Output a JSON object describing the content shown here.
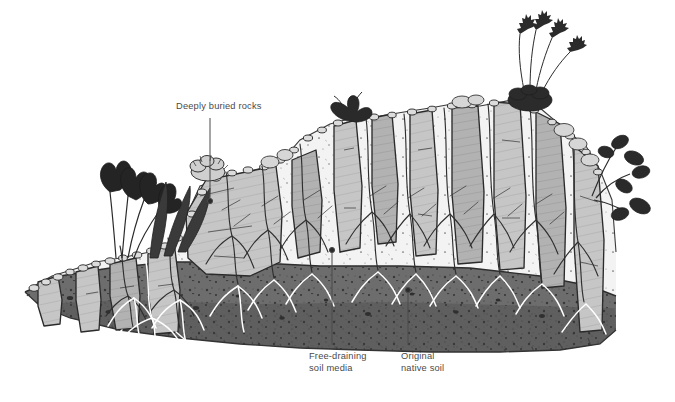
{
  "figure": {
    "type": "cross-section-illustration",
    "medium": "pen-and-ink hatched drawing",
    "background_color": "#ffffff"
  },
  "labels": {
    "deeply_buried_rocks": "Deeply buried rocks",
    "free_draining_media": "Free-draining\nsoil media",
    "original_native_soil": "Original\nnative soil"
  },
  "leaders": [
    {
      "name": "leader-deeply-buried-rocks",
      "x": 210,
      "y1": 118,
      "y2": 201
    },
    {
      "name": "leader-free-draining-media",
      "x": 332,
      "y1": 250,
      "y2": 345
    },
    {
      "name": "leader-original-native-soil",
      "x": 408,
      "y1": 290,
      "y2": 345
    }
  ],
  "colors": {
    "ink": "#2b2b2b",
    "label_text": "#4a4a4a",
    "rock_fill": "#c6c6c6",
    "rock_fill_dark": "#b0b0b0",
    "media_fill": "#f2f2f2",
    "native_soil": "#6d6d6d",
    "native_soil_dark": "#5a5a5a",
    "foliage_dark": "#2e2e2e",
    "gravel_mulch": "#d8d8d8"
  },
  "strata": [
    {
      "name": "free-draining-soil-media",
      "label": "Free-draining soil media",
      "fill": "#f2f2f2",
      "position": "upper"
    },
    {
      "name": "original-native-soil",
      "label": "Original native soil",
      "fill": "#6d6d6d",
      "position": "lower"
    }
  ],
  "rocks": {
    "count": 13,
    "orientation": "vertical slabs",
    "note": "Deeply buried rocks"
  },
  "plants": [
    {
      "name": "dark-flowering-bulb",
      "position": "left",
      "description": "dark trumpet flowers with strap leaves"
    },
    {
      "name": "grassy-tuft",
      "position": "left-center",
      "description": "upright strap leaves"
    },
    {
      "name": "cushion-plant",
      "position": "center",
      "description": "mounded cushion on rock edge"
    },
    {
      "name": "rosette-plant",
      "position": "center-right",
      "description": "dark rosette atop slab"
    },
    {
      "name": "grass-seedheads",
      "position": "right",
      "description": "tall grass with arching seed heads"
    },
    {
      "name": "broadleaf-plant",
      "position": "far-right",
      "description": "dark rounded leaves on wiry stems"
    }
  ]
}
